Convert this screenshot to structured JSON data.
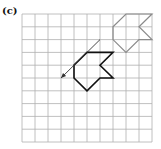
{
  "label": "(c)",
  "grid": {
    "origin_x": 22,
    "origin_y": 14,
    "cell_w": 13,
    "cell_h": 12.8,
    "cols": 10,
    "rows": 10,
    "line_color": "#b0b0b0"
  },
  "shapes": [
    {
      "name": "original-shape",
      "color": "#8a8a8a",
      "width": 1.2,
      "points": [
        [
          8,
          0
        ],
        [
          10,
          0
        ],
        [
          9,
          1
        ],
        [
          10,
          2
        ],
        [
          9,
          2
        ],
        [
          8,
          3
        ],
        [
          7,
          2
        ],
        [
          7,
          1
        ]
      ]
    },
    {
      "name": "translated-shape",
      "color": "#111111",
      "width": 1.6,
      "points": [
        [
          5,
          3
        ],
        [
          7,
          3
        ],
        [
          6,
          4
        ],
        [
          7,
          5
        ],
        [
          6,
          5
        ],
        [
          5,
          6
        ],
        [
          4,
          5
        ],
        [
          4,
          4
        ]
      ]
    }
  ],
  "arrow": {
    "color": "#333333",
    "from": [
      6,
      2
    ],
    "to": [
      3,
      5
    ]
  }
}
